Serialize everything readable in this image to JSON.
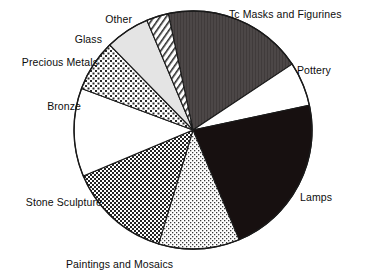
{
  "chart_data": {
    "type": "pie",
    "title": "",
    "subtitle": "",
    "xlabel": "",
    "ylabel": "",
    "legend_position": "none",
    "labels_position": "outside-callout",
    "grid": false,
    "categories": [
      "Tc Masks and Figurines",
      "Pottery",
      "Lamps",
      "Paintings and Mosaics",
      "Stone Sculpture",
      "Bronze",
      "Precious Metals",
      "Glass",
      "Other"
    ],
    "values": [
      19,
      6,
      22,
      11,
      14,
      12,
      7,
      6,
      3
    ],
    "units": "percent",
    "slices": [
      {
        "label": "Tc Masks and Figurines",
        "value": 19,
        "start_angle": -12,
        "end_angle": 56,
        "fill": "dark-gray-solid",
        "color": "#4a4545"
      },
      {
        "label": "Pottery",
        "value": 6,
        "start_angle": 56,
        "end_angle": 78,
        "fill": "white-solid",
        "color": "#ffffff"
      },
      {
        "label": "Lamps",
        "value": 22,
        "start_angle": 78,
        "end_angle": 157,
        "fill": "black-solid",
        "color": "#171010"
      },
      {
        "label": "Paintings and Mosaics",
        "value": 11,
        "start_angle": 157,
        "end_angle": 196,
        "fill": "light-crosshatch",
        "color": "#d6d6d6"
      },
      {
        "label": "Stone Sculpture",
        "value": 14,
        "start_angle": 196,
        "end_angle": 246,
        "fill": "dense-checkerboard",
        "color": "#5e5e5e"
      },
      {
        "label": "Bronze",
        "value": 12,
        "start_angle": 246,
        "end_angle": 289,
        "fill": "white-solid",
        "color": "#ffffff"
      },
      {
        "label": "Precious Metals",
        "value": 7,
        "start_angle": 289,
        "end_angle": 314,
        "fill": "medium-checkerboard",
        "color": "#7a7a7a"
      },
      {
        "label": "Glass",
        "value": 6,
        "start_angle": 314,
        "end_angle": 336,
        "fill": "light-gray-solid",
        "color": "#e2e2e2"
      },
      {
        "label": "Other",
        "value": 3,
        "start_angle": 336,
        "end_angle": 348,
        "fill": "diagonal-stripes",
        "color": "#ffffff"
      }
    ]
  },
  "labels": {
    "tc_masks": "Tc Masks and Figurines",
    "pottery": "Pottery",
    "lamps": "Lamps",
    "paintings": "Paintings and Mosaics",
    "stone_sculpture": "Stone Sculpture",
    "bronze": "Bronze",
    "precious_metals": "Precious Metals",
    "glass": "Glass",
    "other": "Other"
  },
  "geometry": {
    "center_x": 193,
    "center_y": 130,
    "radius": 119
  },
  "colors": {
    "outline": "#1a1a1a",
    "background": "#ffffff",
    "text": "#0d0d0d"
  }
}
